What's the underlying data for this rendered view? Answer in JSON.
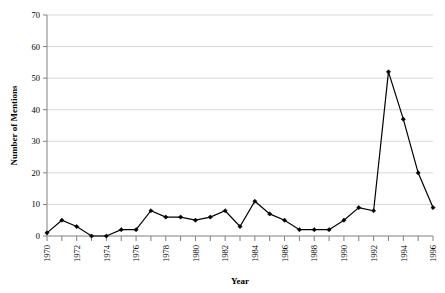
{
  "chart_data": {
    "type": "line",
    "title": "",
    "xlabel": "Year",
    "ylabel": "Number of Mentions",
    "x": [
      1970,
      1971,
      1972,
      1973,
      1974,
      1975,
      1976,
      1977,
      1978,
      1979,
      1980,
      1981,
      1982,
      1983,
      1984,
      1985,
      1986,
      1987,
      1988,
      1989,
      1990,
      1991,
      1992,
      1993,
      1994,
      1995,
      1996
    ],
    "values": [
      1,
      5,
      3,
      0,
      0,
      2,
      2,
      8,
      6,
      6,
      5,
      6,
      8,
      3,
      11,
      7,
      5,
      2,
      2,
      2,
      5,
      9,
      8,
      52,
      37,
      20,
      9
    ],
    "series": [
      {
        "name": "Number of Mentions",
        "values": [
          1,
          5,
          3,
          0,
          0,
          2,
          2,
          8,
          6,
          6,
          5,
          6,
          8,
          3,
          11,
          7,
          5,
          2,
          2,
          2,
          5,
          9,
          8,
          52,
          37,
          20,
          9
        ]
      }
    ],
    "ylim": [
      0,
      70
    ],
    "yticks": [
      0,
      10,
      20,
      30,
      40,
      50,
      60,
      70
    ],
    "ytick_labels": [
      "0",
      "10",
      "20",
      "30",
      "40",
      "50",
      "60",
      "70"
    ],
    "xlim": [
      1970,
      1996
    ],
    "xticks": [
      1970,
      1972,
      1974,
      1976,
      1978,
      1980,
      1982,
      1984,
      1986,
      1988,
      1990,
      1992,
      1994,
      1996
    ],
    "xtick_labels": [
      "1970",
      "1972",
      "1974",
      "1976",
      "1978",
      "1980",
      "1982",
      "1984",
      "1986",
      "1988",
      "1990",
      "1992",
      "1994",
      "1996"
    ],
    "xtick_label_rotation": -90,
    "grid": true,
    "grid_axis": "y",
    "legend": false,
    "legend_position": "none",
    "marker": "diamond",
    "line_color": "#000000",
    "marker_color": "#000000",
    "grid_color": "#d9d9d9",
    "axis_color": "#808080",
    "background_color": "#ffffff"
  }
}
